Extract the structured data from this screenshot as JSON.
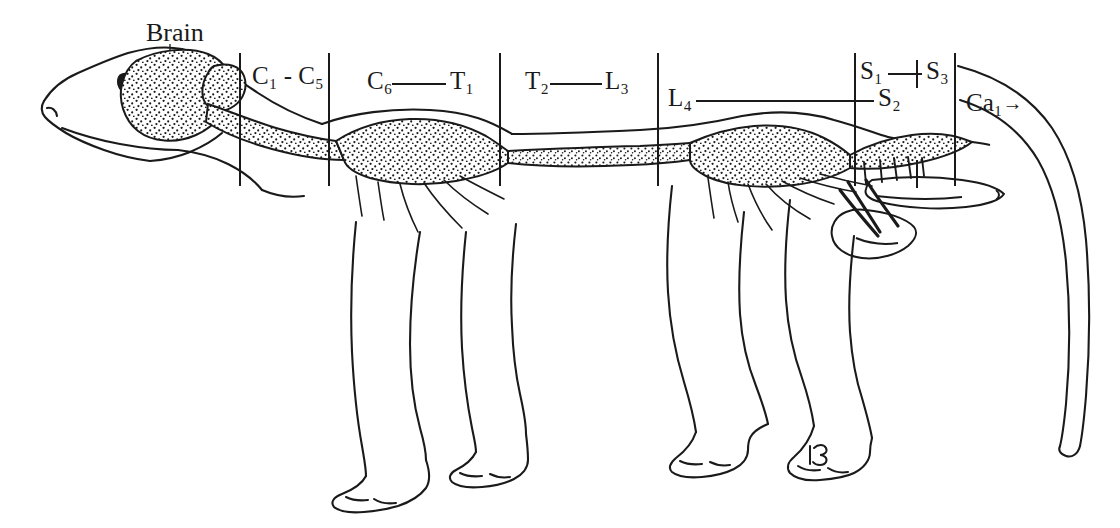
{
  "figure": {
    "background_color": "#ffffff",
    "ink_color": "#1a1a1a"
  },
  "labels": {
    "brain": "Brain",
    "c1c5": "C₁ - C₅",
    "c6": "C₆",
    "t1": "T₁",
    "t2": "T₂",
    "l3": "L₃",
    "l4": "L₄",
    "s2": "S₂",
    "s1": "S₁",
    "s3": "S₃",
    "ca1": "Ca₁",
    "ca1_arrow": "→"
  },
  "segments": [
    {
      "name": "brain",
      "label": "Brain",
      "span_start_x": 110,
      "span_end_x": 240
    },
    {
      "name": "cervical-upper",
      "label": "C₁ - C₅",
      "span_start_x": 240,
      "span_end_x": 329
    },
    {
      "name": "cervical-lower-thoracic-one",
      "label": "C₆ — T₁",
      "span_start_x": 329,
      "span_end_x": 500
    },
    {
      "name": "thoracic-lumbar",
      "label": "T₂ — L₃",
      "span_start_x": 500,
      "span_end_x": 658
    },
    {
      "name": "lumbosacral",
      "label": "L₄ — S₂",
      "span_start_x": 658,
      "span_end_x": 855
    },
    {
      "name": "sacral",
      "label": "S₁ — S₃",
      "span_start_x": 855,
      "span_end_x": 955
    },
    {
      "name": "caudal",
      "label": "Ca₁ →",
      "span_start_x": 955,
      "span_end_x": 1010
    }
  ],
  "divider_lines_x": [
    240,
    329,
    500,
    658,
    855,
    955
  ],
  "divider_line_top_y": 53,
  "divider_line_bottom_y": 185,
  "connector_lines": [
    {
      "name": "c6-t1-connector",
      "x1": 392,
      "x2": 446,
      "y": 84
    },
    {
      "name": "t2-l3-connector",
      "x1": 550,
      "x2": 602,
      "y": 84
    },
    {
      "name": "l4-s2-connector",
      "x1": 696,
      "x2": 874,
      "y": 101
    },
    {
      "name": "s1-s3-connector",
      "x1": 888,
      "x2": 922,
      "y": 74
    }
  ],
  "tick_marks": [
    {
      "name": "s3-upper-tick",
      "x": 917,
      "y1": 60,
      "y2": 88
    },
    {
      "name": "s3-lower-tick",
      "x": 917,
      "y1": 160,
      "y2": 186
    }
  ]
}
